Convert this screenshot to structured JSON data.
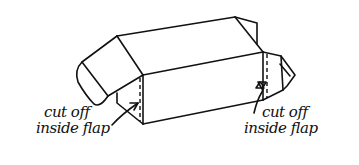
{
  "diagram": {
    "stroke_color": "#111111",
    "background_color": "#ffffff",
    "labels": [
      {
        "id": "left",
        "line1": "cut off",
        "line2": "inside flap"
      },
      {
        "id": "right",
        "line1": "cut off",
        "line2": "inside flap"
      }
    ],
    "annotations": [
      {
        "type": "arrow",
        "from": "left-label",
        "to": "left-inside-flap"
      },
      {
        "type": "arrow",
        "from": "right-label",
        "to": "right-inside-flap"
      },
      {
        "type": "dashed-line",
        "meaning": "fold line of cut-off flap",
        "side": "left"
      },
      {
        "type": "dashed-line",
        "meaning": "fold line of cut-off flap",
        "side": "right"
      }
    ]
  }
}
